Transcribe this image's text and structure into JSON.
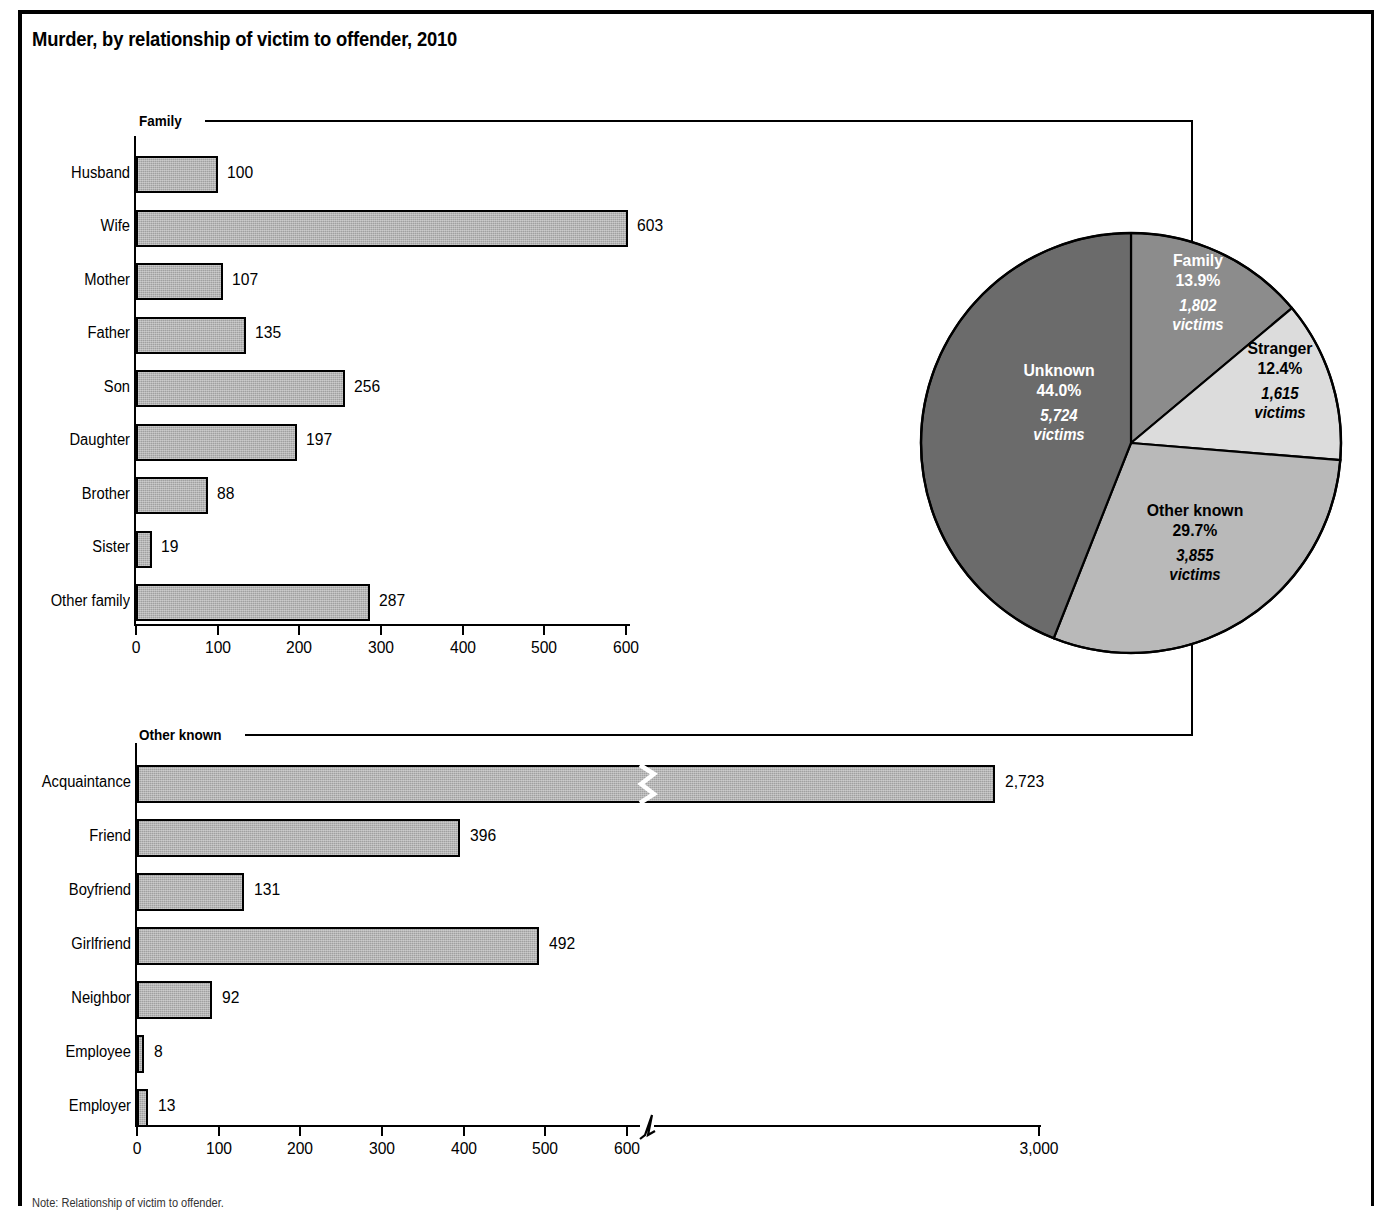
{
  "title": "Murder, by relationship of victim to offender, 2010",
  "footnote": "Note: Relationship of victim to offender.",
  "brackets": {
    "family_label": "Family",
    "other_known_label": "Other known"
  },
  "chart_data": [
    {
      "type": "bar",
      "orientation": "horizontal",
      "title": "Family",
      "xlabel": "",
      "ylabel": "",
      "xlim": [
        0,
        600
      ],
      "grid": false,
      "legend": "none",
      "ticks": [
        "0",
        "100",
        "200",
        "300",
        "400",
        "500",
        "600"
      ],
      "tick_values": [
        0,
        100,
        200,
        300,
        400,
        500,
        600
      ],
      "categories": [
        "Husband",
        "Wife",
        "Mother",
        "Father",
        "Son",
        "Daughter",
        "Brother",
        "Sister",
        "Other family"
      ],
      "values": [
        100,
        603,
        107,
        135,
        256,
        197,
        88,
        19,
        287
      ],
      "value_labels": [
        "100",
        "603",
        "107",
        "135",
        "256",
        "197",
        "88",
        "19",
        "287"
      ]
    },
    {
      "type": "bar",
      "orientation": "horizontal",
      "title": "Other known",
      "xlabel": "",
      "ylabel": "",
      "xlim": [
        0,
        3000
      ],
      "axis_break_after": 600,
      "grid": false,
      "legend": "none",
      "ticks": [
        "0",
        "100",
        "200",
        "300",
        "400",
        "500",
        "600",
        "3,000"
      ],
      "tick_values": [
        0,
        100,
        200,
        300,
        400,
        500,
        600,
        3000
      ],
      "categories": [
        "Acquaintance",
        "Friend",
        "Boyfriend",
        "Girlfriend",
        "Neighbor",
        "Employee",
        "Employer"
      ],
      "values": [
        2723,
        396,
        131,
        492,
        92,
        8,
        13
      ],
      "value_labels": [
        "2,723",
        "396",
        "131",
        "492",
        "92",
        "8",
        "13"
      ],
      "broken_bars": [
        "Acquaintance"
      ]
    },
    {
      "type": "pie",
      "title": "",
      "legend": "inside-slices",
      "labels": [
        "Family",
        "Stranger",
        "Other known",
        "Unknown"
      ],
      "percents": [
        13.9,
        12.4,
        29.7,
        44.0
      ],
      "values": [
        1802,
        1615,
        3855,
        5724
      ],
      "percent_labels": [
        "13.9%",
        "12.4%",
        "29.7%",
        "44.0%"
      ],
      "value_labels": [
        "1,802",
        "1,615",
        "3,855",
        "5,724"
      ],
      "value_suffix": "victims",
      "slice_colors": [
        "#8c8c8c",
        "#dcdcdc",
        "#b9b9b9",
        "#6b6b6b"
      ],
      "text_colors": [
        "#ffffff",
        "#000000",
        "#000000",
        "#ffffff"
      ]
    }
  ],
  "pie_slices": [
    {
      "name": "Family",
      "percent": "13.9%",
      "victims": "1,802",
      "suffix": "victims"
    },
    {
      "name": "Stranger",
      "percent": "12.4%",
      "victims": "1,615",
      "suffix": "victims"
    },
    {
      "name": "Other known",
      "percent": "29.7%",
      "victims": "3,855",
      "suffix": "victims"
    },
    {
      "name": "Unknown",
      "percent": "44.0%",
      "victims": "5,724",
      "suffix": "victims"
    }
  ]
}
